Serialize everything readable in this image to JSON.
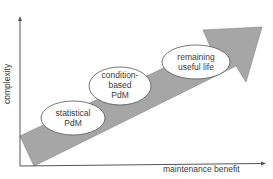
{
  "diagram": {
    "axes": {
      "y_label": "complexity",
      "x_label": "maintenance benefit"
    },
    "arrow": {
      "fill": "#a6a6a6",
      "stroke": "#7f7f7f"
    },
    "stages": [
      {
        "line1": "statistical",
        "line2": "PdM",
        "line3": ""
      },
      {
        "line1": "condition-",
        "line2": "based",
        "line3": "PdM"
      },
      {
        "line1": "remaining",
        "line2": "useful life",
        "line3": ""
      }
    ]
  }
}
